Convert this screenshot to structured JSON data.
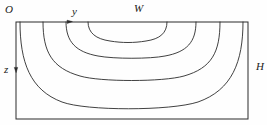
{
  "figure": {
    "stroke_color": "#2b2b2b",
    "background_color": "#fefefe",
    "labels": {
      "origin": "O",
      "horizontal_axis": "y",
      "vertical_axis": "z",
      "width": "W",
      "height": "H"
    },
    "boundary": {
      "name": "cross-section-rectangle",
      "x": 16,
      "y": 22,
      "width": 232,
      "height": 97
    },
    "axis_markers": [
      {
        "name": "y-axis-arrow-marker",
        "x": 70,
        "y": 22
      },
      {
        "name": "z-axis-arrow-marker",
        "x": 16,
        "y": 70
      }
    ],
    "contours": [
      {
        "name": "contour-1-outermost",
        "left_x": 20,
        "right_x": 243,
        "bottom_y": 108,
        "path": "M 20 22 C 20 62, 30 90, 62 102 C 86 111, 170 111, 198 102 C 232 90, 243 62, 243 22"
      },
      {
        "name": "contour-2",
        "left_x": 43,
        "right_x": 220,
        "bottom_y": 80,
        "path": "M 43 22 C 43 52, 52 68, 80 76 C 100 82, 163 82, 184 76 C 212 68, 220 52, 220 22"
      },
      {
        "name": "contour-3",
        "left_x": 66,
        "right_x": 196,
        "bottom_y": 58,
        "path": "M 66 22 C 66 42, 76 52, 98 56 C 114 59, 150 59, 165 56 C 187 52, 196 42, 196 22"
      },
      {
        "name": "contour-4-innermost",
        "left_x": 88,
        "right_x": 167,
        "bottom_y": 42,
        "path": "M 88 22 C 88 33, 96 39, 110 41 C 122 43, 134 43, 146 41 C 160 39, 167 33, 167 22"
      }
    ]
  }
}
